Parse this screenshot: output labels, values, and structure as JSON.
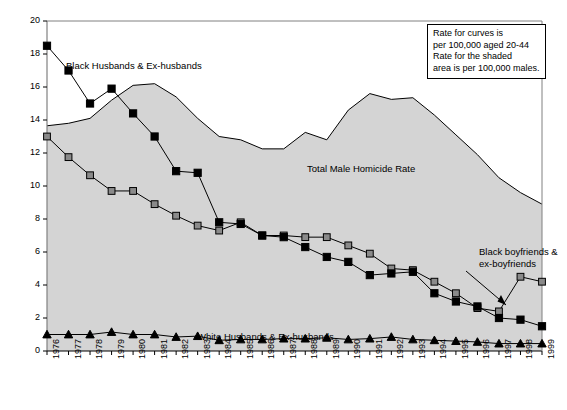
{
  "chart_data": {
    "type": "line",
    "title": "",
    "subtitle": "",
    "xlabel": "",
    "ylabel": "",
    "xlim": [
      1976,
      1999
    ],
    "ylim": [
      0,
      20
    ],
    "ytick_step": 2,
    "grid": false,
    "legend_position": "inline-annotations",
    "categories": [
      "1976",
      "1977",
      "1978",
      "1979",
      "1980",
      "1981",
      "1982",
      "1983",
      "1984",
      "1985",
      "1986",
      "1987",
      "1988",
      "1989",
      "1990",
      "1991",
      "1992",
      "1993",
      "1994",
      "1995",
      "1996",
      "1997",
      "1998",
      "1999"
    ],
    "yticks": [
      "0",
      "2",
      "4",
      "6",
      "8",
      "10",
      "12",
      "14",
      "16",
      "18",
      "20"
    ],
    "series": [
      {
        "name": "Black Husbands & Ex-husbands",
        "marker": "filled-square",
        "color": "#000000",
        "values": [
          18.5,
          17.0,
          15.0,
          15.9,
          14.4,
          13.0,
          10.9,
          10.8,
          7.8,
          7.7,
          7.0,
          6.9,
          6.3,
          5.7,
          5.4,
          4.6,
          4.7,
          4.8,
          3.5,
          3.0,
          2.7,
          2.0,
          1.9,
          1.5
        ]
      },
      {
        "name": "Black boyfriends & ex-boyfriends",
        "marker": "gray-square",
        "color": "#7f7f7f",
        "values": [
          13.0,
          11.75,
          10.65,
          9.7,
          9.7,
          8.9,
          8.2,
          7.6,
          7.3,
          7.8,
          7.0,
          7.0,
          6.9,
          6.9,
          6.4,
          5.9,
          5.0,
          4.9,
          4.2,
          3.5,
          2.6,
          2.4,
          4.5,
          4.2
        ]
      },
      {
        "name": "White Husbands & Ex-husbands",
        "marker": "filled-triangle",
        "color": "#000000",
        "values": [
          1.0,
          1.0,
          1.0,
          1.15,
          1.0,
          1.0,
          0.85,
          0.9,
          0.65,
          0.7,
          0.7,
          0.75,
          0.75,
          0.8,
          0.7,
          0.75,
          0.85,
          0.7,
          0.65,
          0.6,
          0.55,
          0.45,
          0.45,
          0.45
        ]
      },
      {
        "name": "Total Male Homicide Rate",
        "marker": "none",
        "fill": "#d4d4d4",
        "color": "#000000",
        "values": [
          13.65,
          13.8,
          14.1,
          15.2,
          16.1,
          16.2,
          15.4,
          14.1,
          13.0,
          12.8,
          12.25,
          12.25,
          13.25,
          12.8,
          14.6,
          15.6,
          15.25,
          15.35,
          14.3,
          13.1,
          11.9,
          10.5,
          9.6,
          8.9
        ]
      }
    ],
    "annotations": [
      {
        "name": "note-box",
        "lines": [
          "Rate for curves is",
          "per 100,000 aged 20-44",
          "Rate for the shaded",
          "area is per 100,000 males."
        ]
      },
      {
        "name": "black-husbands-label",
        "text": "Black Husbands & Ex-husbands"
      },
      {
        "name": "total-male-homicide-label",
        "text": "Total Male Homicide Rate"
      },
      {
        "name": "white-husbands-label",
        "text": "White Husbands & Ex-husbands"
      },
      {
        "name": "black-boyfriends-label",
        "line1": "Black boyfriends &",
        "line2": "ex-boyfriends"
      }
    ]
  }
}
